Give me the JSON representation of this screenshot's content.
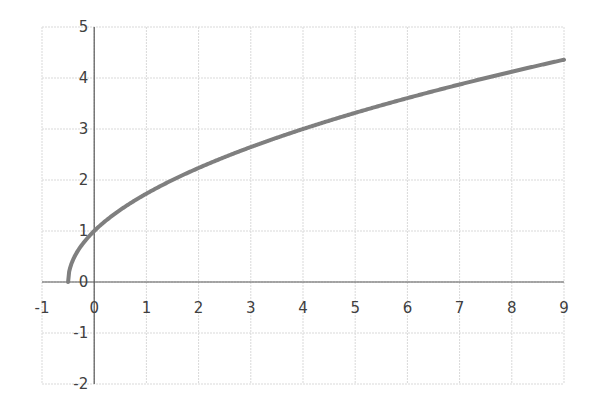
{
  "chart_data": {
    "type": "line",
    "title": "",
    "xlabel": "",
    "ylabel": "",
    "function": "y = sqrt(2x + 1)",
    "xlim": [
      -1,
      9
    ],
    "ylim": [
      -2,
      5
    ],
    "grid": true,
    "legend": null,
    "x_ticks": [
      "-1",
      "0",
      "1",
      "2",
      "3",
      "4",
      "5",
      "6",
      "7",
      "8",
      "9"
    ],
    "y_ticks": [
      "5",
      "4",
      "3",
      "2",
      "1",
      "0",
      "-1",
      "-2"
    ],
    "series": [
      {
        "name": "curve",
        "color": "#7f7f7f",
        "x": [
          -0.5,
          -0.4,
          -0.3,
          -0.2,
          0,
          0.5,
          1,
          1.5,
          2,
          3,
          4,
          5,
          6,
          7,
          8,
          9
        ],
        "y": [
          0,
          0.45,
          0.63,
          0.77,
          1,
          1.41,
          1.73,
          2,
          2.24,
          2.65,
          3,
          3.32,
          3.61,
          3.87,
          4.12,
          4.36
        ]
      }
    ]
  },
  "colors": {
    "grid": "#d9d9d9",
    "axis": "#595959",
    "line": "#7f7f7f",
    "text": "#404040"
  }
}
